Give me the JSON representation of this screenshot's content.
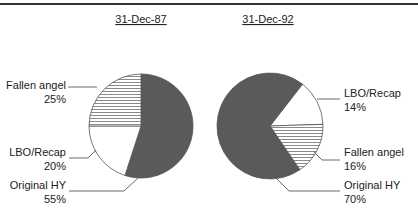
{
  "chart_data": [
    {
      "type": "pie",
      "title": "31-Dec-87",
      "categories": [
        "Original HY",
        "LBO/Recap",
        "Fallen angel"
      ],
      "values": [
        55,
        20,
        25
      ],
      "labels": [
        "55%",
        "20%",
        "25%"
      ],
      "fills": [
        "#5a5a5a",
        "#ffffff",
        "hatch"
      ],
      "label_side": "left"
    },
    {
      "type": "pie",
      "title": "31-Dec-92",
      "categories": [
        "LBO/Recap",
        "Fallen angel",
        "Original HY"
      ],
      "values": [
        14,
        16,
        70
      ],
      "labels": [
        "14%",
        "16%",
        "70%"
      ],
      "fills": [
        "#ffffff",
        "hatch",
        "#5a5a5a"
      ],
      "label_side": "right"
    }
  ],
  "colors": {
    "original_hy": "#5a5a5a",
    "lbo_recap": "#ffffff",
    "fallen_angel_hatch_line": "#8a8a8a",
    "outline": "#555555",
    "top_rule": "#333333"
  }
}
